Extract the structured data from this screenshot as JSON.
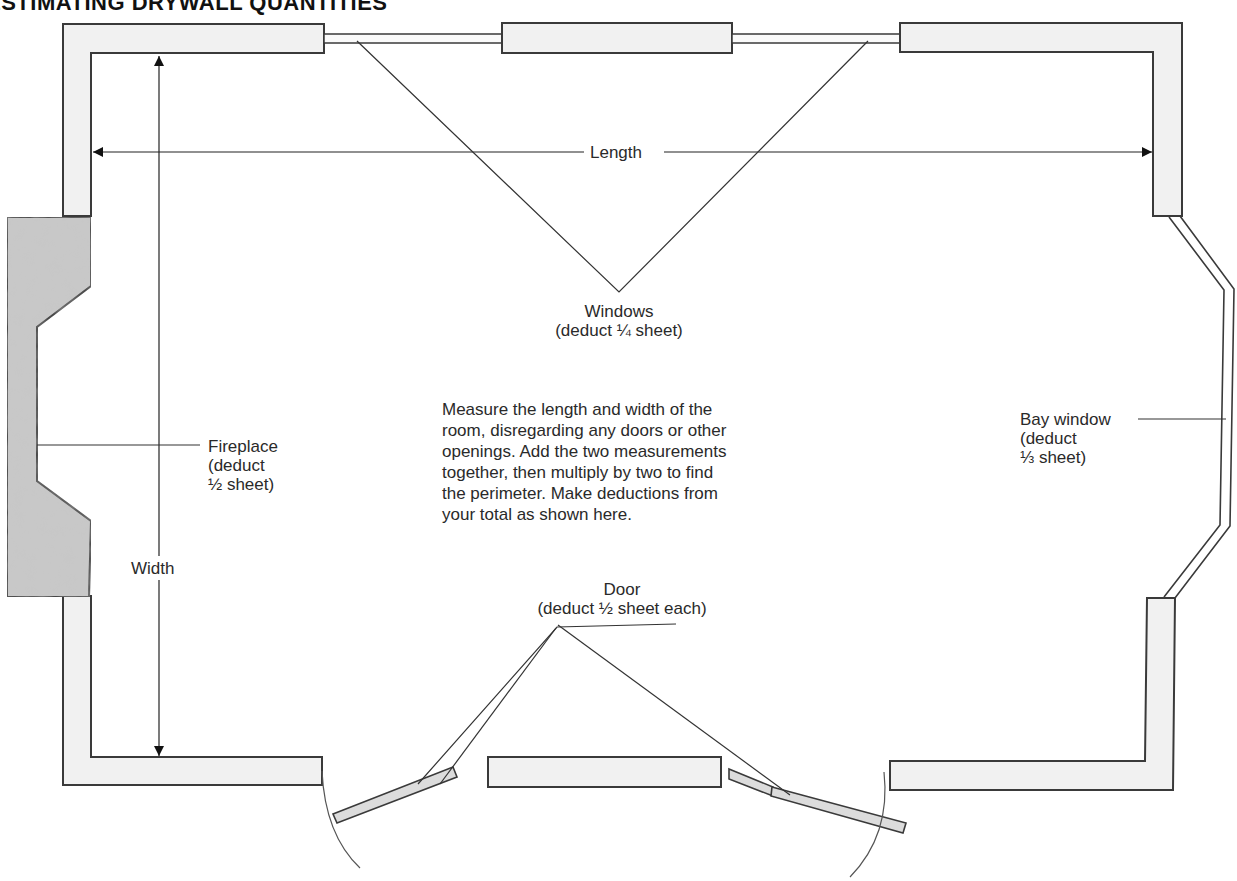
{
  "title": "ESTIMATING DRYWALL QUANTITIES",
  "dimensions": {
    "length_label": "Length",
    "width_label": "Width"
  },
  "callouts": {
    "windows": {
      "name": "Windows",
      "deduction": "(deduct ¼ sheet)"
    },
    "fireplace": {
      "name": "Fireplace",
      "line2": "(deduct",
      "line3": "½ sheet)"
    },
    "bay_window": {
      "name": "Bay window",
      "line2": "(deduct",
      "line3": "⅓ sheet)"
    },
    "door": {
      "name": "Door",
      "deduction": "(deduct ½ sheet each)"
    }
  },
  "instructions": {
    "lines": [
      "Measure the length and width of the",
      "room, disregarding any doors or other",
      "openings. Add the two measurements",
      "together, then multiply by two to find",
      "the perimeter. Make deductions from",
      "your total as shown here."
    ]
  },
  "colors": {
    "wall_fill": "#f1f1f1",
    "wall_stroke": "#3a3a3a",
    "fireplace_fill": "#c9c9c9",
    "line": "#333333"
  }
}
